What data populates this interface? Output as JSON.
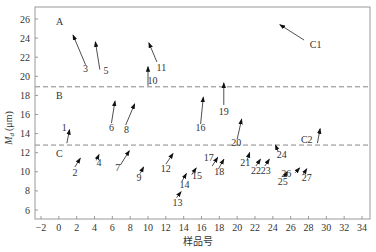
{
  "chart_data": {
    "type": "scatter",
    "title": "",
    "xlabel": "样品号",
    "ylabel": "M_d (μm)",
    "xlim": [
      -2,
      35
    ],
    "ylim": [
      5,
      27
    ],
    "xticks": [
      -2,
      0,
      2,
      4,
      6,
      8,
      10,
      12,
      14,
      16,
      18,
      20,
      22,
      24,
      26,
      28,
      30,
      32,
      34
    ],
    "yticks": [
      6,
      8,
      10,
      12,
      14,
      16,
      18,
      20,
      22,
      24,
      26
    ],
    "grid": false,
    "legend": null,
    "threshold_lines": [
      {
        "y": 18.9,
        "style": "dashed",
        "description": "A/B boundary"
      },
      {
        "y": 12.8,
        "style": "dashed",
        "description": "B/C boundary"
      }
    ],
    "regions": [
      {
        "label": "A",
        "x": -1,
        "y": 25.7
      },
      {
        "label": "B",
        "x": -1,
        "y": 17.9
      },
      {
        "label": "C",
        "x": -1,
        "y": 11.9
      }
    ],
    "points": [
      {
        "id": "1",
        "x": 1.2,
        "y": 14.4,
        "tail": [
          0.9,
          13.0
        ],
        "label_pos": [
          0.6,
          14.6
        ]
      },
      {
        "id": "2",
        "x": 2.4,
        "y": 11.4,
        "tail": [
          1.8,
          10.5
        ],
        "label_pos": [
          1.8,
          9.9
        ]
      },
      {
        "id": "3",
        "x": 1.6,
        "y": 24.3,
        "tail": [
          3.0,
          21.2
        ],
        "label_pos": [
          3.0,
          20.8
        ]
      },
      {
        "id": "4",
        "x": 4.5,
        "y": 11.8,
        "tail": [
          4.2,
          11.2
        ],
        "label_pos": [
          4.5,
          10.9
        ]
      },
      {
        "id": "5",
        "x": 4.1,
        "y": 23.6,
        "tail": [
          4.6,
          20.7
        ],
        "label_pos": [
          5.3,
          20.6
        ]
      },
      {
        "id": "6",
        "x": 6.3,
        "y": 17.4,
        "tail": [
          5.9,
          15.1
        ],
        "label_pos": [
          5.9,
          14.6
        ]
      },
      {
        "id": "7",
        "x": 7.9,
        "y": 12.2,
        "tail": [
          6.9,
          10.7
        ],
        "label_pos": [
          6.6,
          10.4
        ]
      },
      {
        "id": "8",
        "x": 8.5,
        "y": 17.1,
        "tail": [
          7.5,
          14.9
        ],
        "label_pos": [
          7.6,
          14.4
        ]
      },
      {
        "id": "9",
        "x": 9.5,
        "y": 10.5,
        "tail": [
          9.1,
          9.8
        ],
        "label_pos": [
          9.0,
          9.3
        ]
      },
      {
        "id": "10",
        "x": 10.0,
        "y": 21.0,
        "tail": [
          10.0,
          19.0
        ],
        "label_pos": [
          10.5,
          19.5
        ]
      },
      {
        "id": "11",
        "x": 10.1,
        "y": 23.5,
        "tail": [
          11.0,
          21.5
        ],
        "label_pos": [
          11.5,
          20.9
        ]
      },
      {
        "id": "12",
        "x": 12.8,
        "y": 11.9,
        "tail": [
          12.0,
          10.8
        ],
        "label_pos": [
          12.0,
          10.3
        ]
      },
      {
        "id": "13",
        "x": 13.7,
        "y": 7.9,
        "tail": [
          13.2,
          7.3
        ],
        "label_pos": [
          13.3,
          6.7
        ]
      },
      {
        "id": "14",
        "x": 14.3,
        "y": 9.8,
        "tail": [
          13.8,
          9.0
        ],
        "label_pos": [
          14.1,
          8.6
        ]
      },
      {
        "id": "15",
        "x": 15.4,
        "y": 10.4,
        "tail": [
          14.9,
          9.7
        ],
        "label_pos": [
          15.5,
          9.6
        ]
      },
      {
        "id": "16",
        "x": 16.2,
        "y": 17.8,
        "tail": [
          15.9,
          15.0
        ],
        "label_pos": [
          15.9,
          14.6
        ]
      },
      {
        "id": "17",
        "x": 17.8,
        "y": 11.5,
        "tail": [
          17.2,
          10.6
        ],
        "label_pos": [
          16.8,
          11.4
        ]
      },
      {
        "id": "18",
        "x": 18.5,
        "y": 11.3,
        "tail": [
          17.9,
          10.3
        ],
        "label_pos": [
          18.0,
          10.0
        ]
      },
      {
        "id": "19",
        "x": 18.5,
        "y": 19.3,
        "tail": [
          18.5,
          17.0
        ],
        "label_pos": [
          18.5,
          16.3
        ]
      },
      {
        "id": "20",
        "x": 20.5,
        "y": 15.5,
        "tail": [
          20.0,
          13.4
        ],
        "label_pos": [
          19.9,
          13.0
        ]
      },
      {
        "id": "21",
        "x": 21.4,
        "y": 12.0,
        "tail": [
          21.1,
          11.2
        ],
        "label_pos": [
          20.9,
          10.9
        ]
      },
      {
        "id": "22",
        "x": 22.6,
        "y": 11.3,
        "tail": [
          22.1,
          10.6
        ],
        "label_pos": [
          22.1,
          10.1
        ]
      },
      {
        "id": "23",
        "x": 23.6,
        "y": 11.3,
        "tail": [
          23.1,
          10.6
        ],
        "label_pos": [
          23.2,
          10.1
        ]
      },
      {
        "id": "24",
        "x": 24.3,
        "y": 12.8,
        "tail": [
          24.6,
          12.1
        ],
        "label_pos": [
          25.0,
          11.8
        ]
      },
      {
        "id": "25",
        "x": 25.6,
        "y": 10.0,
        "tail": [
          25.3,
          9.5
        ],
        "label_pos": [
          25.1,
          8.9
        ]
      },
      {
        "id": "26",
        "x": 27.0,
        "y": 10.4,
        "tail": [
          26.5,
          9.9
        ],
        "label_pos": [
          25.5,
          9.8
        ]
      },
      {
        "id": "27",
        "x": 27.8,
        "y": 10.3,
        "tail": [
          27.4,
          9.7
        ],
        "label_pos": [
          27.8,
          9.4
        ]
      },
      {
        "id": "C1",
        "x": 24.8,
        "y": 25.4,
        "tail": [
          27.5,
          23.8
        ],
        "label_pos": [
          28.8,
          23.3
        ]
      },
      {
        "id": "C2",
        "x": 29.3,
        "y": 14.5,
        "tail": [
          29.0,
          13.0
        ],
        "label_pos": [
          27.8,
          13.3
        ]
      }
    ]
  },
  "axes": {
    "x_title": "样品号",
    "y_title_main": "M",
    "y_title_sub": "d",
    "y_title_unit": "(μm)"
  }
}
